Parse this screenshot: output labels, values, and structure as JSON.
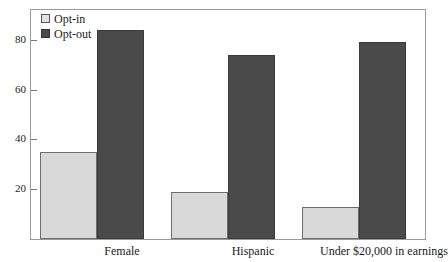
{
  "chart_data": {
    "type": "bar",
    "title": "",
    "subtitle": "",
    "xlabel": "",
    "ylabel": "",
    "categories": [
      "Female",
      "Hispanic",
      "Under $20,000 in earnings"
    ],
    "series": [
      {
        "name": "Opt-in",
        "color": "#d9d9d9",
        "values": [
          35,
          19,
          13
        ]
      },
      {
        "name": "Opt-out",
        "color": "#4a4a4a",
        "values": [
          84,
          74,
          79
        ]
      }
    ],
    "ylim": [
      0,
      92
    ],
    "yticks": [
      20,
      40,
      60,
      80
    ],
    "ytick_labels": [
      "20",
      "40",
      "60",
      "80"
    ],
    "grid": false,
    "legend_position": "top-left",
    "frame": true
  },
  "legend": {
    "entries": [
      {
        "label": "Opt-in",
        "swatch": "light-square-swatch"
      },
      {
        "label": "Opt-out",
        "swatch": "dark-square-swatch"
      }
    ]
  },
  "axes": {
    "y_tick_labels": [
      "80",
      "60",
      "40",
      "20"
    ],
    "x_tick_labels": [
      "Female",
      "Hispanic",
      "Under $20,000 in earnings"
    ]
  }
}
